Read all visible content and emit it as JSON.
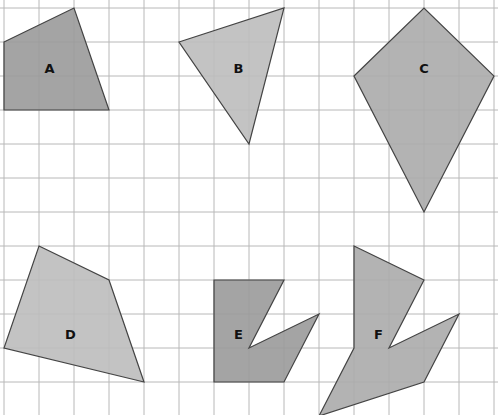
{
  "grid": {
    "origin_x": 4,
    "origin_y": 8,
    "cell_w": 35,
    "cell_h": 34,
    "cols": 14,
    "rows": 12,
    "line_color": "#b8b8b8"
  },
  "shapes": [
    {
      "id": "A",
      "label": "A",
      "fill": "#9a9a9a",
      "points": [
        [
          0,
          1
        ],
        [
          2,
          0
        ],
        [
          3,
          3
        ],
        [
          0,
          3
        ]
      ],
      "label_pos": [
        1.3,
        1.75
      ]
    },
    {
      "id": "B",
      "label": "B",
      "fill": "#bdbdbd",
      "points": [
        [
          5,
          1
        ],
        [
          8,
          0
        ],
        [
          7,
          4
        ]
      ],
      "label_pos": [
        6.7,
        1.75
      ]
    },
    {
      "id": "C",
      "label": "C",
      "fill": "#ababab",
      "points": [
        [
          10,
          2
        ],
        [
          12,
          0
        ],
        [
          14,
          2
        ],
        [
          12,
          6
        ]
      ],
      "label_pos": [
        12,
        1.75
      ]
    },
    {
      "id": "D",
      "label": "D",
      "fill": "#bdbdbd",
      "points": [
        [
          1,
          7
        ],
        [
          3,
          8
        ],
        [
          4,
          11
        ],
        [
          0,
          10
        ]
      ],
      "label_pos": [
        1.9,
        9.6
      ]
    },
    {
      "id": "E",
      "label": "E",
      "fill": "#9a9a9a",
      "points": [
        [
          6,
          8
        ],
        [
          8,
          8
        ],
        [
          7,
          10
        ],
        [
          9,
          9
        ],
        [
          8,
          11
        ],
        [
          6,
          11
        ]
      ],
      "label_pos": [
        6.7,
        9.6
      ]
    },
    {
      "id": "F",
      "label": "F",
      "fill": "#ababab",
      "points": [
        [
          10,
          7
        ],
        [
          12,
          8
        ],
        [
          11,
          10
        ],
        [
          13,
          9
        ],
        [
          12,
          11
        ],
        [
          9,
          12
        ],
        [
          10,
          10
        ]
      ],
      "label_pos": [
        10.7,
        9.6
      ]
    }
  ]
}
